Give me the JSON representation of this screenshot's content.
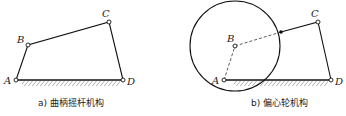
{
  "figures": [
    {
      "caption": "a) 曲柄摇杆机构",
      "points": {
        "A": "A",
        "B": "B",
        "C": "C",
        "D": "D"
      }
    },
    {
      "caption": "b) 偏心轮机构",
      "points": {
        "A": "A",
        "B": "B",
        "C": "C",
        "D": "D"
      }
    }
  ]
}
